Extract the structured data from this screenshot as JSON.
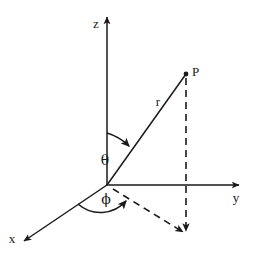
{
  "figure": {
    "type": "diagram",
    "background_color": "#ffffff",
    "stroke_color": "#1a1a1a",
    "width": 258,
    "height": 257
  },
  "origin": {
    "label": "O",
    "x": 107,
    "y": 185
  },
  "axes": [
    {
      "key": "z",
      "label": "z",
      "label_x": 96,
      "label_y": 28,
      "from_x": 107,
      "from_y": 185,
      "to_x": 107,
      "to_y": 16,
      "arrow": true
    },
    {
      "key": "y",
      "label": "y",
      "label_x": 236,
      "label_y": 202,
      "from_x": 107,
      "from_y": 185,
      "to_x": 240,
      "to_y": 185,
      "arrow": true
    },
    {
      "key": "x",
      "label": "x",
      "label_x": 10,
      "label_y": 243,
      "from_x": 107,
      "from_y": 185,
      "to_x": 23,
      "to_y": 242,
      "arrow": true
    }
  ],
  "point": {
    "label": "P",
    "x": 186,
    "y": 74,
    "label_x": 192,
    "label_y": 74,
    "dot_radius": 2.3
  },
  "radius": {
    "label": "r",
    "label_x": 158,
    "label_y": 105,
    "from_x": 107,
    "from_y": 185,
    "to_x": 186,
    "to_y": 74
  },
  "angles": [
    {
      "key": "theta",
      "label": "θ",
      "label_x": 105,
      "label_y": 164,
      "description": "polar-angle-from-z-axis"
    },
    {
      "key": "phi",
      "label": "ϕ",
      "label_x": 105,
      "label_y": 203,
      "description": "azimuthal-angle-from-x-axis"
    }
  ],
  "projection": {
    "vertical_dashed": {
      "from_x": 186,
      "from_y": 74,
      "to_x": 186,
      "to_y": 234
    },
    "ground_dashed": {
      "from_x": 107,
      "from_y": 185,
      "to_x": 186,
      "to_y": 234
    },
    "dash_pattern": "7,5"
  }
}
